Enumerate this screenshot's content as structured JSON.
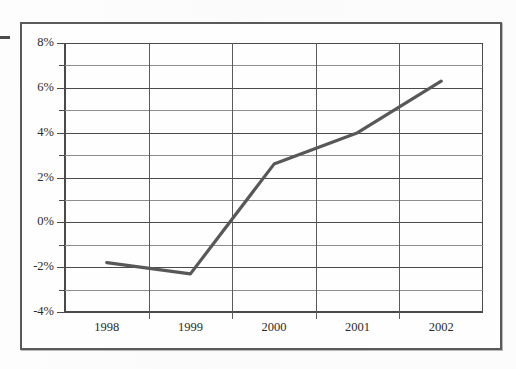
{
  "chart_data": {
    "type": "line",
    "title": "",
    "subtitle": "",
    "xlabel": "",
    "ylabel": "",
    "categories": [
      "1998",
      "1999",
      "2000",
      "2001",
      "2002"
    ],
    "x": [
      1998,
      1999,
      2000,
      2001,
      2002
    ],
    "series": [
      {
        "name": "Annual rate",
        "values": [
          -1.8,
          -2.3,
          2.6,
          4.0,
          6.3
        ],
        "color": "#585858"
      }
    ],
    "values": [
      -1.8,
      -2.3,
      2.6,
      4.0,
      6.3
    ],
    "ylim": [
      -4,
      8
    ],
    "ytick_values": [
      8,
      6,
      4,
      2,
      0,
      -2,
      -4
    ],
    "ytick_labels": [
      "8%",
      "6%",
      "4%",
      "2%",
      "0%",
      "-2%",
      "-4%"
    ],
    "minor_gridline_values": [
      7,
      5,
      3,
      1,
      -1,
      -3
    ],
    "grid": true,
    "grid_interval": 1,
    "legend": false,
    "legend_position": "none",
    "annotations": []
  },
  "figure": {
    "edge_mark": "crop-mark",
    "frame_color": "#5a5a5a",
    "plot_border_color": "#4a4a4a",
    "gridline_color": "#8e8e8e",
    "line_color": "#585858",
    "background": "#fefefe"
  }
}
